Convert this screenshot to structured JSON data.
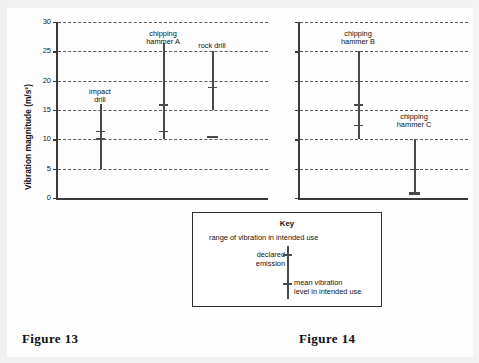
{
  "figures": {
    "left_caption": "Figure 13",
    "right_caption": "Figure 14"
  },
  "key": {
    "title": "Key",
    "range_label": "range of vibration in intended use",
    "declared_label_line1": "declared",
    "declared_label_line2": "emission",
    "mean_label_line1": "mean vibration",
    "mean_label_line2": "level in intended use"
  },
  "chart_data": [
    {
      "type": "bar",
      "title": "Figure 13",
      "xlabel": "",
      "ylabel": "Vibration magnitude (m/s²)",
      "ylim": [
        0,
        30
      ],
      "yticks": [
        0,
        5,
        10,
        15,
        20,
        25,
        30
      ],
      "ytick_labels": [
        "0",
        "5",
        "10",
        "15",
        "20",
        "25",
        "30"
      ],
      "grid": true,
      "legend": "none",
      "units": "m/s²",
      "categories": [
        "impact drill",
        "chipping hammer A",
        "rock drill"
      ],
      "series": [
        {
          "name": "impact drill",
          "label_line1": "impact",
          "label_line2": "drill",
          "range_min": 5.0,
          "range_max": 16.0,
          "declared_emission": 11.5,
          "mean_vibration": 10.2,
          "detached_mean": null
        },
        {
          "name": "chipping hammer A",
          "label_line1": "chipping",
          "label_line2": "hammer A",
          "range_min": 10.0,
          "range_max": 26.5,
          "declared_emission": 16.0,
          "mean_vibration": 11.5,
          "detached_mean": null
        },
        {
          "name": "rock drill",
          "label_line1": "rock drill",
          "label_line2": "",
          "range_min": 15.0,
          "range_max": 25.0,
          "declared_emission": 19.0,
          "mean_vibration": null,
          "detached_mean": 10.5
        }
      ]
    },
    {
      "type": "bar",
      "title": "Figure 14",
      "xlabel": "",
      "ylabel": "",
      "ylim": [
        0,
        30
      ],
      "yticks": [
        0,
        5,
        10,
        15,
        20,
        25,
        30
      ],
      "ytick_labels": [
        "",
        "",
        "",
        "",
        "",
        "",
        ""
      ],
      "grid": true,
      "legend": "none",
      "units": "m/s²",
      "categories": [
        "chipping hammer B",
        "chipping hammer C"
      ],
      "series": [
        {
          "name": "chipping hammer B",
          "label_line1": "chipping",
          "label_line2": "hammer B",
          "range_min": 10.0,
          "range_max": 25.0,
          "declared_emission": 16.0,
          "mean_vibration": 12.5,
          "detached_mean": null
        },
        {
          "name": "chipping hammer C",
          "label_line1": "chipping",
          "label_line2": "hammer C",
          "range_min": 1.0,
          "range_max": 10.0,
          "declared_emission": 5.0,
          "mean_vibration": 1.0,
          "detached_mean": null
        }
      ]
    }
  ]
}
